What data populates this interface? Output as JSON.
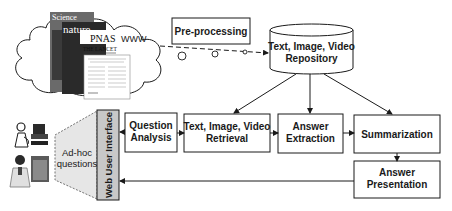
{
  "diagram": {
    "source": {
      "cloud_label": "WWW",
      "journals": [
        "Science",
        "nature",
        "PNAS",
        "THE LANCET"
      ]
    },
    "preprocessing": {
      "label": "Pre-processing"
    },
    "repository": {
      "line1": "Text, Image, Video",
      "line2": "Repository"
    },
    "users": {
      "questions_line1": "Ad-hoc",
      "questions_line2": "questions",
      "interface_label": "Web User Interface"
    },
    "pipeline": [
      {
        "id": "question-analysis",
        "line1": "Question",
        "line2": "Analysis"
      },
      {
        "id": "retrieval",
        "line1": "Text, Image, Video",
        "line2": "Retrieval"
      },
      {
        "id": "answer-extraction",
        "line1": "Answer",
        "line2": "Extraction"
      },
      {
        "id": "summarization",
        "line1": "Summarization",
        "line2": ""
      },
      {
        "id": "answer-presentation",
        "line1": "Answer",
        "line2": "Presentation"
      }
    ],
    "colors": {
      "stroke": "#1a1a1a",
      "interface_fill": "#c8c8c8",
      "trapezoid_fill": "#e6e6e6",
      "background": "#ffffff"
    }
  }
}
